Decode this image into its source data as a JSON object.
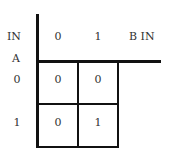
{
  "diagram": {
    "type": "karnaugh-map",
    "row_variable": {
      "line1": "IN",
      "line2": "A"
    },
    "column_variable": "B IN",
    "column_headers": [
      "0",
      "1"
    ],
    "row_headers": [
      "0",
      "1"
    ],
    "cells": [
      [
        "0",
        "0"
      ],
      [
        "0",
        "1"
      ]
    ],
    "line_color": "#111111"
  }
}
